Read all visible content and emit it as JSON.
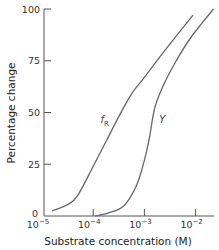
{
  "chart_data": {
    "type": "line",
    "title": "",
    "xlabel": "Substrate concentration (M)",
    "ylabel": "Percentage change",
    "xscale": "log",
    "xlim": [
      1e-05,
      0.02
    ],
    "ylim": [
      0,
      100
    ],
    "grid": false,
    "legend": "inline curve labels",
    "x_ticks": [
      "10-5",
      "10-4",
      "10-3",
      "10-2"
    ],
    "y_ticks": [
      "0",
      "25",
      "50",
      "75",
      "100"
    ],
    "series": [
      {
        "name": "fR",
        "label_main": "f",
        "label_sub": "R",
        "log10_x": [
          -4.8,
          -4.5,
          -4.3,
          -4.0,
          -3.75,
          -3.5,
          -3.25,
          -3.0,
          -2.6,
          -2.05
        ],
        "values": [
          2.5,
          5.5,
          10,
          24,
          36,
          48,
          59,
          67,
          80,
          97
        ]
      },
      {
        "name": "Y",
        "label_main": "Y",
        "label_sub": "",
        "log10_x": [
          -3.96,
          -3.7,
          -3.4,
          -3.15,
          -3.0,
          -2.9,
          -2.8,
          -2.65,
          -2.4,
          -2.1,
          -1.65
        ],
        "values": [
          0,
          1.5,
          5,
          15,
          27,
          38,
          52,
          62,
          74,
          86,
          100
        ]
      }
    ],
    "annotations": [
      {
        "text": "fR",
        "near_series": "fR",
        "log10_x": -3.7,
        "y": 47
      },
      {
        "text": "Y",
        "near_series": "Y",
        "log10_x": -2.75,
        "y": 47
      }
    ]
  },
  "axes": {
    "y_ticks": [
      {
        "label": "0",
        "value": 0
      },
      {
        "label": "25",
        "value": 25
      },
      {
        "label": "50",
        "value": 50
      },
      {
        "label": "75",
        "value": 75
      },
      {
        "label": "100",
        "value": 100
      }
    ],
    "x_ticks": [
      {
        "base": "10",
        "exp": "−5",
        "log": -5
      },
      {
        "base": "10",
        "exp": "−4",
        "log": -4
      },
      {
        "base": "10",
        "exp": "−3",
        "log": -3
      },
      {
        "base": "10",
        "exp": "−2",
        "log": -2
      }
    ],
    "xlabel": "Substrate concentration (M)",
    "ylabel": "Percentage change"
  },
  "style": {
    "axis_color": "#555555",
    "curve_color": "#666666"
  }
}
